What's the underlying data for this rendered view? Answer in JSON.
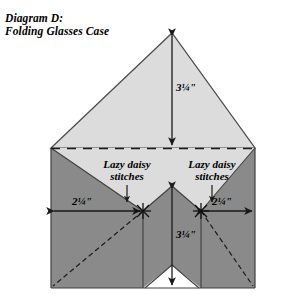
{
  "diagram": {
    "title_line1": "Diagram D:",
    "title_line2": "Folding Glasses Case",
    "title": "Diagram D:\nFolding Glasses Case",
    "labels": {
      "top_height": "3¼\"",
      "bottom_height": "3¼\"",
      "left_width": "2¼\"",
      "right_width": "2¼\"",
      "stitch_left_line1": "Lazy daisy",
      "stitch_left_line2": "stitches",
      "stitch_right_line1": "Lazy daisy",
      "stitch_right_line2": "stitches"
    },
    "colors": {
      "flap_light": "#dcdcdc",
      "body_dark": "#8a8a8a",
      "outline": "#3a3a3a",
      "background": "#ffffff",
      "text": "#000000"
    },
    "icons": {
      "arrow_top": "double-arrow-vertical-icon",
      "arrow_bottom": "double-arrow-vertical-icon",
      "arrow_left": "double-arrow-horizontal-icon",
      "arrow_right": "double-arrow-horizontal-icon",
      "pointer_left": "arrow-down-icon",
      "pointer_right": "arrow-down-icon",
      "stitch_mark_left": "lazy-daisy-stitch-mark-icon",
      "stitch_mark_right": "lazy-daisy-stitch-mark-icon",
      "fold_line": "dashed-fold-line-icon"
    }
  }
}
